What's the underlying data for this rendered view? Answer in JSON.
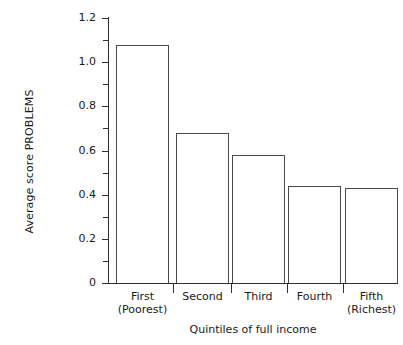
{
  "chart_data": {
    "type": "bar",
    "title": "",
    "categories": [
      "First (Poorest)",
      "Second",
      "Third",
      "Fourth",
      "Fifth (Richest)"
    ],
    "category_lines": [
      [
        "First",
        "(Poorest)"
      ],
      [
        "Second",
        ""
      ],
      [
        "Third",
        ""
      ],
      [
        "Fourth",
        ""
      ],
      [
        "Fifth",
        "(Richest)"
      ]
    ],
    "values": [
      1.08,
      0.68,
      0.58,
      0.44,
      0.43
    ],
    "xlabel": "Quintiles of full income",
    "ylabel": "Average score PROBLEMS",
    "ylim": [
      0,
      1.2
    ],
    "ytick_labels": [
      "1.2",
      "1.0",
      "0.8",
      "0.6",
      "0.4",
      "0.2",
      "0"
    ],
    "ytick_values": [
      1.2,
      1.0,
      0.8,
      0.6,
      0.4,
      0.2,
      0
    ],
    "yminor_values": [
      1.1,
      0.9,
      0.7,
      0.5,
      0.3,
      0.1
    ],
    "grid": false,
    "legend": false,
    "bar_fill_color": "#ffffff",
    "bar_edge_color": "#4a4a4a",
    "axis_color": "#303030",
    "background_color": "#ffffff"
  }
}
